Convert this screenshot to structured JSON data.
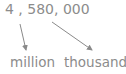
{
  "number": "4 , 580, 000",
  "labels": {
    "million": "million",
    "thousand": "thousand"
  },
  "colors": {
    "text": "#8c8c8c",
    "arrow": "#8a8a8a"
  },
  "arrows": [
    {
      "from": "4",
      "to": "million"
    },
    {
      "from": "580",
      "to": "thousand"
    }
  ]
}
